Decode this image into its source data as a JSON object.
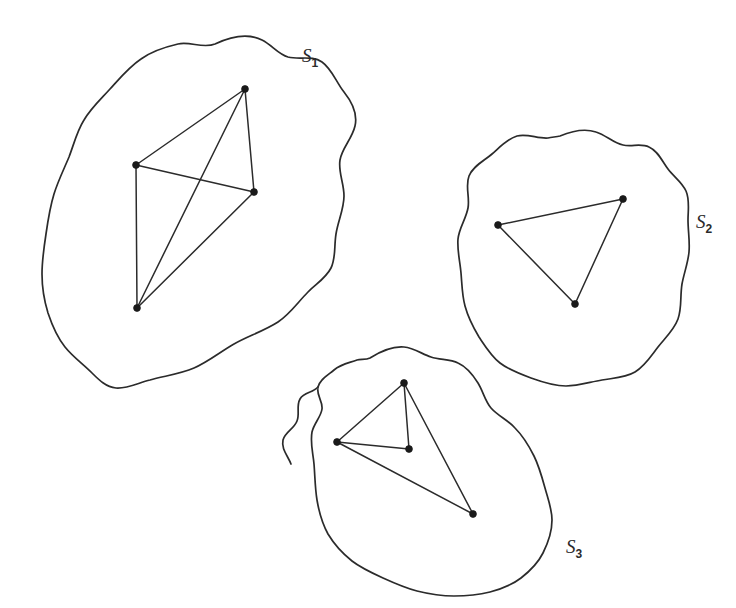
{
  "figure": {
    "background_color": "#ffffff",
    "ink_color": "#2b2b2b",
    "width": 736,
    "height": 608
  },
  "regions": [
    {
      "id": "S1",
      "label_base": "S",
      "label_subscript": "1",
      "label_x": 302,
      "label_y": 62,
      "outline_path": "M 215 44 C 232 36 248 33 262 40 C 272 45 278 54 288 57 C 300 60 312 55 322 62 C 332 69 336 82 344 92 C 352 102 358 113 355 126 C 352 139 342 148 340 160 C 338 172 344 183 344 196 C 344 209 338 221 336 234 C 334 246 336 258 331 268 C 326 278 316 284 308 292 C 298 302 290 314 278 322 C 264 331 248 336 234 344 C 220 352 208 362 194 368 C 180 374 164 376 150 380 C 138 383 127 389 116 388 C 106 387 99 380 92 373 C 83 364 73 357 65 347 C 57 337 52 325 48 313 C 44 300 42 287 42 274 C 42 260 44 247 46 234 C 48 220 50 207 54 194 C 58 181 64 169 69 157 C 74 144 77 131 84 120 C 91 108 101 99 110 89 C 120 78 129 67 141 59 C 152 51 165 47 178 44 C 190 41 203 49 215 44 Z",
      "vertices": [
        {
          "name": "top",
          "x": 245,
          "y": 89
        },
        {
          "name": "left",
          "x": 136,
          "y": 165
        },
        {
          "name": "right",
          "x": 254,
          "y": 192
        },
        {
          "name": "bottom",
          "x": 137,
          "y": 308
        }
      ],
      "edges": [
        {
          "from": 0,
          "to": 1
        },
        {
          "from": 0,
          "to": 2
        },
        {
          "from": 0,
          "to": 3
        },
        {
          "from": 1,
          "to": 2
        },
        {
          "from": 1,
          "to": 3
        },
        {
          "from": 2,
          "to": 3
        }
      ]
    },
    {
      "id": "S2",
      "label_base": "S",
      "label_subscript": "2",
      "label_x": 696,
      "label_y": 228,
      "outline_path": "M 560 136 C 572 131 584 128 596 132 C 606 135 613 143 623 145 C 632 147 641 143 649 147 C 658 151 662 161 668 169 C 674 177 682 182 686 191 C 690 200 688 210 688 220 C 688 231 690 241 689 252 C 688 263 684 273 682 284 C 680 296 682 308 678 319 C 674 330 665 338 658 347 C 651 356 645 366 635 372 C 625 378 613 378 602 380 C 590 382 578 386 566 386 C 554 386 542 382 531 378 C 520 374 509 370 500 363 C 491 356 485 346 479 337 C 473 327 468 317 465 306 C 462 295 462 284 461 273 C 460 261 457 250 458 239 C 459 228 466 219 468 208 C 470 197 465 186 469 176 C 473 166 484 161 492 154 C 500 147 507 139 517 136 C 527 133 538 139 548 138 C 552 137 556 137 560 136 Z",
      "vertices": [
        {
          "name": "left",
          "x": 498,
          "y": 225
        },
        {
          "name": "top-right",
          "x": 623,
          "y": 199
        },
        {
          "name": "bottom",
          "x": 575,
          "y": 304
        }
      ],
      "edges": [
        {
          "from": 0,
          "to": 1
        },
        {
          "from": 1,
          "to": 2
        },
        {
          "from": 2,
          "to": 0
        }
      ]
    },
    {
      "id": "S3",
      "label_base": "S",
      "label_subscript": "3",
      "label_x": 566,
      "label_y": 553,
      "outline_path": "M 370 358 C 381 351 392 346 404 347 C 414 348 422 354 431 357 C 440 360 450 359 458 363 C 467 367 473 375 478 383 C 483 391 485 401 491 408 C 498 416 508 420 515 428 C 523 436 529 446 534 456 C 539 466 542 477 545 488 C 548 499 552 509 552 520 C 552 532 548 543 543 553 C 538 563 530 571 521 578 C 512 585 501 589 490 592 C 478 595 466 596 454 596 C 441 596 429 594 417 591 C 405 588 394 583 383 578 C 372 573 361 568 352 561 C 342 553 334 544 328 534 C 322 523 319 512 317 500 C 315 488 315 476 314 464 C 313 453 310 443 312 432 C 314 423 321 417 322 409 C 323 401 316 395 318 387 C 320 379 328 375 334 370 C 341 364 349 363 357 360 C 361 359 366 360 370 358 Z",
      "outline_notch_path": "M 318 387 C 313 393 304 392 300 399 C 296 406 300 414 297 421 C 294 429 285 432 283 440 C 281 449 288 456 291 464",
      "vertices": [
        {
          "name": "top",
          "x": 404,
          "y": 383
        },
        {
          "name": "left",
          "x": 337,
          "y": 442
        },
        {
          "name": "middle",
          "x": 409,
          "y": 449
        },
        {
          "name": "bottom-right",
          "x": 473,
          "y": 514
        }
      ],
      "edges": [
        {
          "from": 0,
          "to": 1
        },
        {
          "from": 0,
          "to": 2
        },
        {
          "from": 1,
          "to": 2
        },
        {
          "from": 0,
          "to": 3
        },
        {
          "from": 1,
          "to": 3
        }
      ]
    }
  ]
}
